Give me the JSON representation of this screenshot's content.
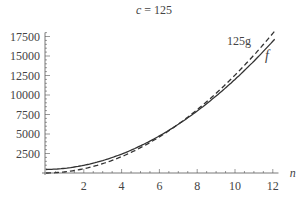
{
  "title": {
    "var": "c",
    "eq": " = 125"
  },
  "labels": {
    "dashed": "125g",
    "solid": "f",
    "xaxis": "n"
  },
  "colors": {
    "axis": "#555555",
    "curve": "#333333",
    "text": "#444444"
  },
  "chart_data": {
    "type": "line",
    "title": "c = 125",
    "xlabel": "n",
    "ylabel": "",
    "xlim": [
      0,
      12.1
    ],
    "ylim": [
      0,
      18000
    ],
    "xticks": [
      2,
      4,
      6,
      8,
      10,
      12
    ],
    "yticks": [
      2500,
      5000,
      7500,
      10000,
      12500,
      15000,
      17500
    ],
    "grid": false,
    "legend": "inline labels near curve ends (125g above, f below)",
    "series": [
      {
        "name": "f",
        "style": "solid",
        "x": [
          0,
          2,
          4,
          6,
          8,
          10,
          12
        ],
        "y": [
          450,
          1000,
          2500,
          4900,
          7900,
          11800,
          17600
        ]
      },
      {
        "name": "125g",
        "style": "dashed",
        "x": [
          0,
          2,
          4,
          6,
          8,
          10,
          12
        ],
        "y": [
          0,
          550,
          2100,
          4700,
          7900,
          12000,
          17900
        ]
      }
    ]
  }
}
